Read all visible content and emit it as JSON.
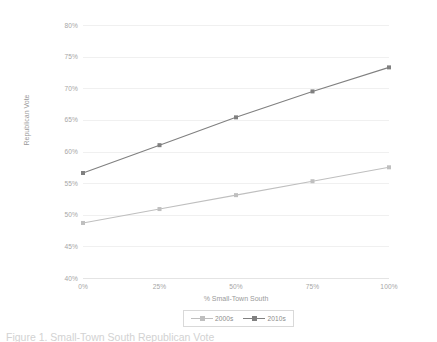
{
  "chart_data": {
    "type": "line",
    "title": "",
    "xlabel": "% Small-Town South",
    "ylabel": "Republican Vote",
    "x": [
      0,
      25,
      50,
      75,
      100
    ],
    "categories": [
      "0%",
      "25%",
      "50%",
      "75%",
      "100%"
    ],
    "series": [
      {
        "name": "2000s",
        "color": "#bfbfbf",
        "values": [
          48.7,
          50.9,
          53.1,
          55.3,
          57.5
        ]
      },
      {
        "name": "2010s",
        "color": "#808080",
        "values": [
          56.6,
          61.0,
          65.4,
          69.5,
          73.3
        ]
      }
    ],
    "xlim": [
      0,
      100
    ],
    "ylim": [
      40,
      80
    ],
    "ytick_labels": [
      "80%",
      "75%",
      "70%",
      "65%",
      "60%",
      "55%",
      "50%",
      "45%",
      "40%"
    ],
    "ytick_values": [
      80,
      75,
      70,
      65,
      60,
      55,
      50,
      45,
      40
    ],
    "grid": true,
    "legend_position": "bottom"
  },
  "axes": {
    "y_title": "Republican Vote",
    "x_title": "% Small-Town South"
  },
  "legend": {
    "entries": [
      {
        "label": "2000s",
        "color": "#bfbfbf"
      },
      {
        "label": "2010s",
        "color": "#808080"
      }
    ]
  },
  "caption": {
    "text": "Figure 1. Small-Town South Republican Vote"
  },
  "colors": {
    "series_2000s": "#bfbfbf",
    "series_2010s": "#808080",
    "gridline": "#f0f0f0",
    "tick_text": "#a6a6a6",
    "axis_title_text": "#9a9a9a",
    "legend_border": "#d9d9d9",
    "background": "#ffffff"
  }
}
